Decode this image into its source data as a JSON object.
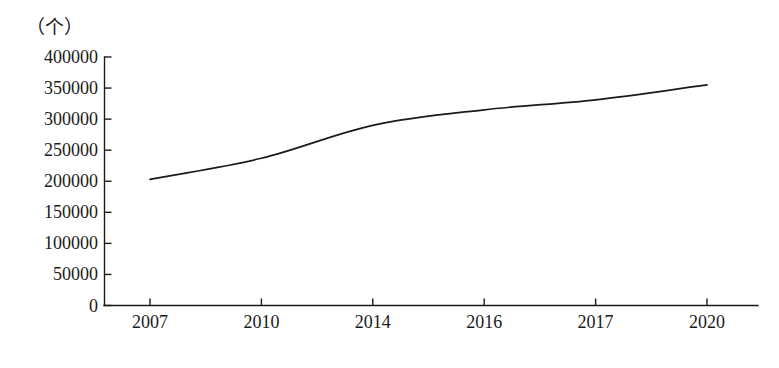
{
  "chart_data": {
    "type": "line",
    "title": "",
    "subtitle": "",
    "xlabel": "",
    "ylabel": "",
    "unit_label": "（个）",
    "grid": false,
    "legend": false,
    "legend_position": "none",
    "line_color": "#1a1a1a",
    "axis_color": "#1a1a1a",
    "background": "#ffffff",
    "categories": [
      "2007",
      "2010",
      "2014",
      "2016",
      "2017",
      "2020"
    ],
    "x": [
      "2007",
      "2010",
      "2014",
      "2016",
      "2017",
      "2020"
    ],
    "values": [
      203000,
      237000,
      290000,
      315000,
      331000,
      355000
    ],
    "series": [
      {
        "name": "数量",
        "values": [
          203000,
          237000,
          290000,
          315000,
          331000,
          355000
        ]
      }
    ],
    "ylim": [
      0,
      400000
    ],
    "yticks": [
      0,
      50000,
      100000,
      150000,
      200000,
      250000,
      300000,
      350000,
      400000
    ],
    "ytick_labels": [
      "0",
      "50000",
      "100000",
      "150000",
      "200000",
      "250000",
      "300000",
      "350000",
      "400000"
    ],
    "xtick_labels": [
      "2007",
      "2010",
      "2014",
      "2016",
      "2017",
      "2020"
    ],
    "annotations": []
  }
}
